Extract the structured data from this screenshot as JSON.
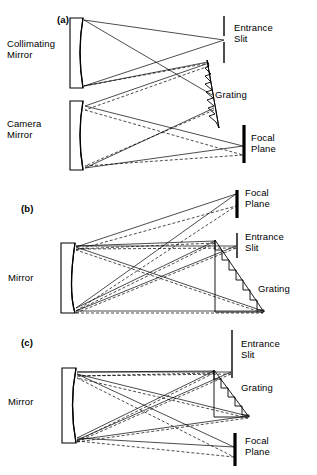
{
  "figure": {
    "type": "optical-schematic",
    "background_color": "#ffffff",
    "line_color": "#000000"
  },
  "panels": [
    {
      "tag": "(a)",
      "labels": {
        "collimating_mirror": "Collimating\nMirror",
        "camera_mirror": "Camera\nMirror",
        "entrance_slit": "Entrance\nSlit",
        "grating": "Grating",
        "focal_plane": "Focal\nPlane"
      },
      "components": [
        "collimating-mirror",
        "camera-mirror",
        "entrance-slit",
        "grating",
        "focal-plane"
      ]
    },
    {
      "tag": "(b)",
      "labels": {
        "mirror": "Mirror",
        "focal_plane": "Focal\nPlane",
        "entrance_slit": "Entrance\nSlit",
        "grating": "Grating"
      },
      "components": [
        "mirror",
        "entrance-slit",
        "grating",
        "focal-plane"
      ]
    },
    {
      "tag": "(c)",
      "labels": {
        "mirror": "Mirror",
        "entrance_slit": "Entrance\nSlit",
        "grating": "Grating",
        "focal_plane": "Focal\nPlane"
      },
      "components": [
        "mirror",
        "entrance-slit",
        "grating",
        "focal-plane"
      ]
    }
  ],
  "ray_legend": {
    "solid": "ray bundle (wavelength 1)",
    "dashed": "ray bundle (wavelength 2)"
  }
}
